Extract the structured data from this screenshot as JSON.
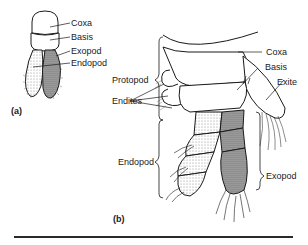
{
  "figure_a": {
    "caption": "(a)",
    "labels": {
      "coxa": "Coxa",
      "basis": "Basis",
      "exopod": "Exopod",
      "endopod": "Endopod"
    }
  },
  "figure_b": {
    "caption": "(b)",
    "labels": {
      "coxa": "Coxa",
      "basis": "Basis",
      "exite": "Exite",
      "protopod": "Protopod",
      "endites": "Endites",
      "endopod": "Endopod",
      "exopod": "Exopod"
    }
  },
  "colors": {
    "ink": "#1a1a1a",
    "stipple_light": "#e6e6e6",
    "stipple_dark": "#9a9a9a",
    "background": "#ffffff"
  }
}
